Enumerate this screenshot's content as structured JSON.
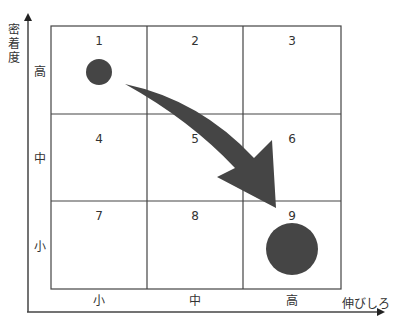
{
  "diagram": {
    "y_axis_label": [
      "密",
      "着",
      "度"
    ],
    "x_axis_label": "伸びしろ",
    "row_labels": [
      "高",
      "中",
      "小"
    ],
    "col_labels": [
      "小",
      "中",
      "高"
    ],
    "cells": [
      "1",
      "2",
      "3",
      "4",
      "5",
      "6",
      "7",
      "8",
      "9"
    ],
    "shape_color": "#454545",
    "start_cell": "1",
    "end_cell": "9",
    "start_marker": "small-circle",
    "end_marker": "large-circle",
    "connector": "curved-arrow"
  }
}
